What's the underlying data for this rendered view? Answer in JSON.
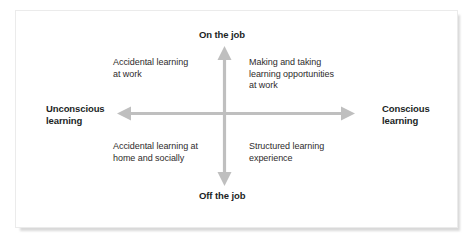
{
  "figure": {
    "type": "quadrant-matrix",
    "background_color": "#ffffff",
    "frame_border_color": "#ebebeb",
    "arrow_color": "#bfbfbf",
    "axis_label_color": "#221f1f",
    "quadrant_text_color": "#2e2b2b"
  },
  "axes": {
    "vertical": {
      "top_label": "On the job",
      "bottom_label": "Off the job"
    },
    "horizontal": {
      "left_label": "Unconscious\nlearning",
      "right_label": "Conscious\nlearning"
    }
  },
  "quadrants": [
    {
      "position": "top-left",
      "text": "Accidental learning\nat work",
      "vertical_axis": "On the job",
      "horizontal_axis": "Unconscious learning"
    },
    {
      "position": "top-right",
      "text": "Making and taking\nlearning opportunities\nat work",
      "vertical_axis": "On the job",
      "horizontal_axis": "Conscious learning"
    },
    {
      "position": "bottom-left",
      "text": "Accidental learning at\nhome and socially",
      "vertical_axis": "Off the job",
      "horizontal_axis": "Unconscious learning"
    },
    {
      "position": "bottom-right",
      "text": "Structured learning\nexperience",
      "vertical_axis": "Off the job",
      "horizontal_axis": "Conscious learning"
    }
  ]
}
